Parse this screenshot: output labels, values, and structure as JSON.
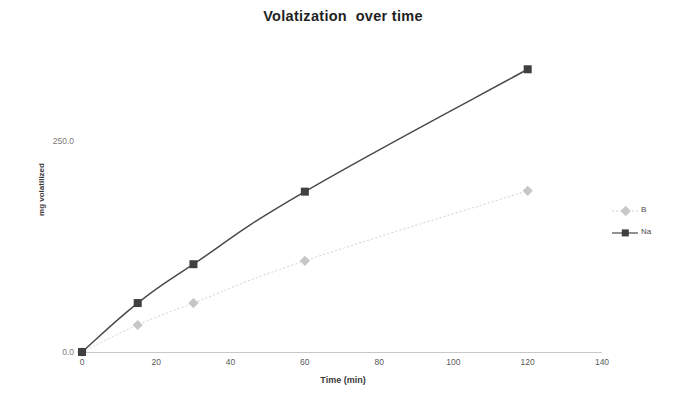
{
  "chart_data": {
    "type": "line",
    "title": "Volatization  over time",
    "xlabel": "Time (min)",
    "ylabel": "mg volatilized",
    "xlim": [
      0,
      140
    ],
    "ylim": [
      0,
      250
    ],
    "xticks": [
      0,
      20,
      40,
      60,
      80,
      100,
      120,
      140
    ],
    "xtick_labels": [
      "0",
      "20",
      "40",
      "60",
      "80",
      "100",
      "120",
      "140"
    ],
    "yticks": [
      0,
      250
    ],
    "ytick_labels": [
      "0.0",
      "250.0"
    ],
    "grid": false,
    "legend_position": "right",
    "x": [
      0,
      15,
      30,
      60,
      120
    ],
    "series": [
      {
        "name": "B",
        "values": [
          0,
          32,
          58,
          108,
          191
        ],
        "color": "#d2d2d2",
        "marker": "diamond",
        "linestyle": "dotted"
      },
      {
        "name": "Na",
        "values": [
          0,
          58,
          104,
          190,
          335
        ],
        "color": "#4a4a4a",
        "marker": "square",
        "linestyle": "solid"
      }
    ]
  },
  "legend": {
    "items": [
      {
        "label": "B"
      },
      {
        "label": "Na"
      }
    ]
  }
}
